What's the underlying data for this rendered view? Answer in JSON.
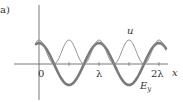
{
  "figure_label": "a)",
  "axes": {
    "x_label": "x",
    "x_ticks": [
      "0",
      "λ",
      "2λ"
    ]
  },
  "curves": {
    "u_label": "u",
    "ey_label_main": "E",
    "ey_label_sub": "y"
  },
  "colors": {
    "axis": "#555555",
    "u_curve": "#8a8a8a",
    "ey_curve": "#777777"
  }
}
